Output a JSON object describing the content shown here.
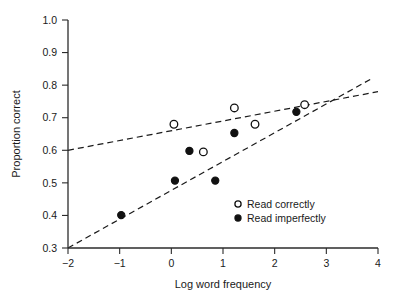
{
  "chart_data": {
    "type": "scatter",
    "title": "",
    "xlabel": "Log word frequency",
    "ylabel": "Proportion correct",
    "xlim": [
      -2,
      4
    ],
    "ylim": [
      0.3,
      1.0
    ],
    "xticks": [
      -2,
      -1,
      0,
      1,
      2,
      3,
      4
    ],
    "xtick_labels": [
      "−2",
      "−1",
      "0",
      "1",
      "2",
      "3",
      "4"
    ],
    "yticks": [
      0.3,
      0.4,
      0.5,
      0.6,
      0.7,
      0.8,
      0.9,
      1.0
    ],
    "ytick_labels": [
      "0.3",
      "0.4",
      "0.5",
      "0.6",
      "0.7",
      "0.8",
      "0.9",
      "1.0"
    ],
    "grid": false,
    "legend_position": "lower-right",
    "series": [
      {
        "name": "Read correctly",
        "marker": "open-circle",
        "points": [
          {
            "x": 0.05,
            "y": 0.68
          },
          {
            "x": 0.62,
            "y": 0.595
          },
          {
            "x": 1.22,
            "y": 0.73
          },
          {
            "x": 1.62,
            "y": 0.68
          },
          {
            "x": 2.58,
            "y": 0.74
          }
        ]
      },
      {
        "name": "Read imperfectly",
        "marker": "filled-circle",
        "points": [
          {
            "x": -0.97,
            "y": 0.401
          },
          {
            "x": 0.07,
            "y": 0.507
          },
          {
            "x": 0.35,
            "y": 0.598
          },
          {
            "x": 0.85,
            "y": 0.507
          },
          {
            "x": 1.22,
            "y": 0.653
          },
          {
            "x": 2.42,
            "y": 0.718
          }
        ]
      }
    ],
    "fit_lines": [
      {
        "name": "Read correctly fit",
        "style": "dashed",
        "x0": -2.0,
        "y0": 0.6,
        "x1": 4.0,
        "y1": 0.78
      },
      {
        "name": "Read imperfectly fit",
        "style": "dashed",
        "x0": -2.0,
        "y0": 0.3,
        "x1": 3.9,
        "y1": 0.822
      }
    ],
    "legend": [
      {
        "label": "Read correctly",
        "marker": "open-circle"
      },
      {
        "label": "Read imperfectly",
        "marker": "filled-circle"
      }
    ]
  }
}
